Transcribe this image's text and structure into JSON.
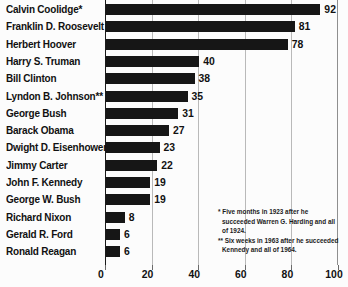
{
  "chart_data": {
    "type": "bar",
    "orientation": "horizontal",
    "title": "",
    "xlabel": "",
    "ylabel": "",
    "xlim": [
      0,
      100
    ],
    "xticks": [
      0,
      20,
      40,
      60,
      80,
      100
    ],
    "grid": true,
    "legend": false,
    "categories": [
      "Calvin Coolidge*",
      "Franklin D. Roosevelt",
      "Herbert Hoover",
      "Harry S. Truman",
      "Bill Clinton",
      "Lyndon B. Johnson**",
      "George Bush",
      "Barack Obama",
      "Dwight D. Eisenhower",
      "Jimmy Carter",
      "John F. Kennedy",
      "George W. Bush",
      "Richard Nixon",
      "Gerald R. Ford",
      "Ronald Reagan"
    ],
    "values": [
      92,
      81,
      78,
      40,
      38,
      35,
      31,
      27,
      23,
      22,
      19,
      19,
      8,
      6,
      6
    ],
    "value_labels": [
      "92",
      "81",
      "78",
      "40",
      "38",
      "35",
      "31",
      "27",
      "23",
      "22",
      "19",
      "19",
      "8",
      "6",
      "6"
    ],
    "tick_labels": [
      "0",
      "20",
      "40",
      "60",
      "80",
      "100"
    ],
    "annotations": [
      "* Five months in 1923 after he succeeded Warren G. Harding and all of 1924.",
      "** Six weeks in 1963 after he succeeded Kennedy and all of 1964."
    ],
    "colors": {
      "bar": "#161616",
      "background": "#fcfcfc",
      "gridline": "#b9b9b9",
      "text": "#111111"
    }
  }
}
